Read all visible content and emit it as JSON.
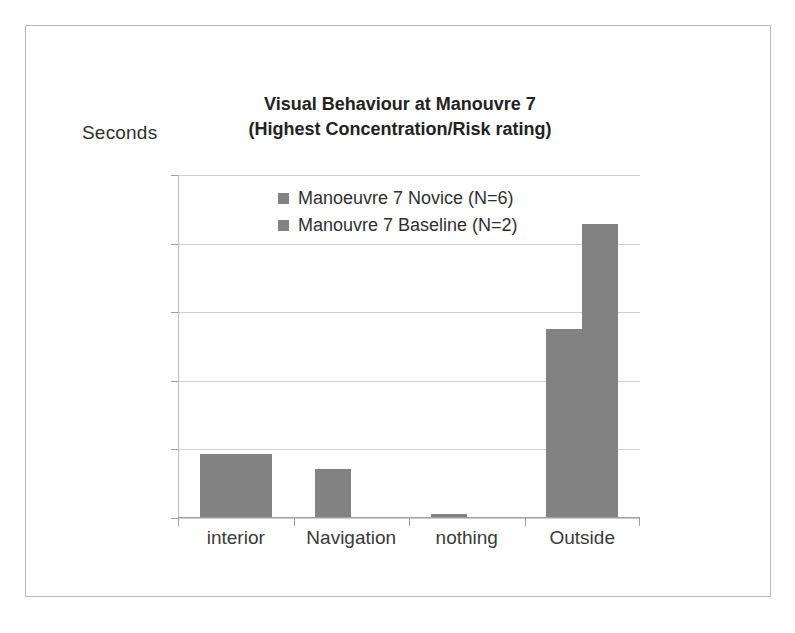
{
  "chart_data": {
    "type": "bar",
    "title": "Visual Behaviour at Manouvre 7 (Highest Concentration/Risk rating)",
    "title_lines": [
      "Visual Behaviour at Manouvre 7",
      "(Highest Concentration/Risk rating)"
    ],
    "xlabel": "",
    "ylabel": "Seconds",
    "categories": [
      "interior",
      "Navigation",
      "nothing",
      "Outside"
    ],
    "series": [
      {
        "name": "Manoeuvre 7 Novice (N=6)",
        "color": "#828282",
        "values": [
          4.7,
          3.6,
          0.3,
          13.8
        ]
      },
      {
        "name": "Manouvre 7 Baseline (N=2)",
        "color": "#828282",
        "values": [
          4.7,
          0,
          0,
          21.4
        ]
      }
    ],
    "ylim": [
      0,
      25
    ],
    "yticks": [
      0,
      5,
      10,
      15,
      20,
      25
    ],
    "ytick_labels": [
      "0",
      "5",
      "10",
      "15",
      "20",
      "25"
    ],
    "grid": true,
    "legend_position": "inside-top-center"
  }
}
